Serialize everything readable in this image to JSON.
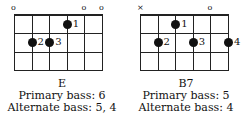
{
  "chords": [
    {
      "name": "E",
      "primary_bass": "Primary bass: 6",
      "alternate_bass": "Alternate bass: 5, 4",
      "markers": [
        {
          "string": 6,
          "symbol": "o"
        },
        {
          "string": 2,
          "symbol": "o"
        },
        {
          "string": 1,
          "symbol": "o"
        }
      ],
      "dots": [
        {
          "string": 3,
          "fret": 1,
          "finger": "1"
        },
        {
          "string": 5,
          "fret": 2,
          "finger": "2"
        },
        {
          "string": 4,
          "fret": 2,
          "finger": "3"
        }
      ]
    },
    {
      "name": "B7",
      "primary_bass": "Primary bass: 5",
      "alternate_bass": "Alternate bass: 4",
      "markers": [
        {
          "string": 6,
          "symbol": "×"
        },
        {
          "string": 2,
          "symbol": "o"
        }
      ],
      "dots": [
        {
          "string": 4,
          "fret": 1,
          "finger": "1"
        },
        {
          "string": 5,
          "fret": 2,
          "finger": "2"
        },
        {
          "string": 3,
          "fret": 2,
          "finger": "3"
        },
        {
          "string": 1,
          "fret": 2,
          "finger": "4"
        }
      ]
    }
  ]
}
